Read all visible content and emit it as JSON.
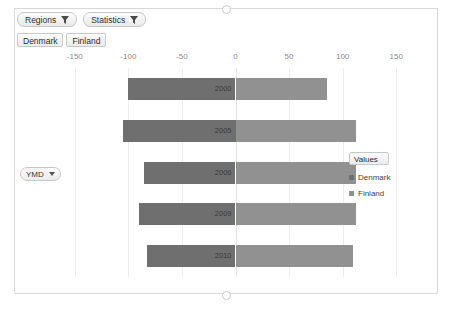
{
  "toolbar": {
    "filters": [
      {
        "label": "Regions",
        "icon": "filter-funnel-icon"
      },
      {
        "label": "Statistics",
        "icon": "filter-funnel-icon"
      }
    ],
    "slicer_values": [
      "Denmark",
      "Finland"
    ],
    "hierarchy_button": {
      "label": "YMD",
      "icon": "chevron-down-icon"
    }
  },
  "legend": {
    "title": "Values",
    "entries": [
      {
        "label": "Denmark",
        "color": "#6f6f6f"
      },
      {
        "label": "Finland",
        "color": "#919191"
      }
    ]
  },
  "chart_data": {
    "type": "bar",
    "orientation": "horizontal",
    "variant": "diverging",
    "title": "",
    "xlabel": "",
    "ylabel": "",
    "categories": [
      "2000",
      "2005",
      "2006",
      "2009",
      "2010"
    ],
    "tick_labels": [
      "-150",
      "-100",
      "-50",
      "0",
      "50",
      "100",
      "150"
    ],
    "tick_values": [
      -150,
      -100,
      -50,
      0,
      50,
      100,
      150
    ],
    "xlim": [
      -175,
      175
    ],
    "grid": true,
    "legend_position": "right",
    "series": [
      {
        "name": "Denmark",
        "color": "#6f6f6f",
        "values": [
          -100,
          -105,
          -85,
          -90,
          -83
        ]
      },
      {
        "name": "Finland",
        "color": "#919191",
        "values": [
          85,
          112,
          112,
          112,
          110
        ]
      }
    ]
  }
}
